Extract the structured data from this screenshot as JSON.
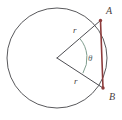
{
  "figure": {
    "type": "geometry-diagram",
    "width": 122,
    "height": 120,
    "background_color": "#ffffff"
  },
  "colors": {
    "circle_stroke": "#59595c",
    "radius_stroke": "#4d4d52",
    "chord_stroke": "#8d3b3b",
    "angle_arc_stroke": "#7f9d8e",
    "point_marker": "#8d3b3b",
    "label_color": "#4a3f3f",
    "theta_label_color": "#59696b"
  },
  "geometry": {
    "circle": {
      "center_x": 57,
      "center_y": 58,
      "radius": 50,
      "stroke_width": 1
    },
    "center_point": {
      "x": 57,
      "y": 58
    },
    "point_a": {
      "x": 100.5,
      "y": 20.5
    },
    "point_b": {
      "x": 103,
      "y": 88
    },
    "angle_arc": {
      "radius": 30,
      "start_angle_deg": -40.7,
      "end_angle_deg": 30.5
    }
  },
  "labels": {
    "point_a": {
      "text": "A",
      "x": 106,
      "y": 12,
      "font_size": 10
    },
    "point_b": {
      "text": "B",
      "x": 109,
      "y": 98,
      "font_size": 10
    },
    "radius_upper": {
      "text": "r",
      "x": 73,
      "y": 31,
      "font_size": 9
    },
    "radius_lower": {
      "text": "r",
      "x": 74,
      "y": 82,
      "font_size": 9
    },
    "theta": {
      "text": "θ",
      "x": 88,
      "y": 59,
      "font_size": 9
    }
  }
}
